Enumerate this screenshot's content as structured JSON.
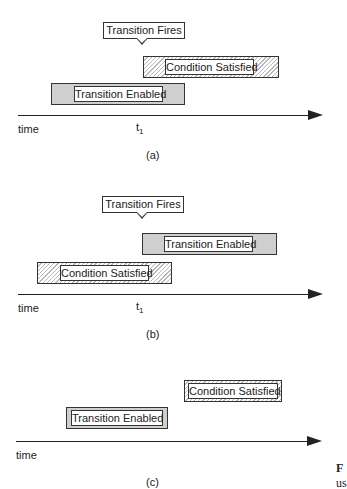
{
  "panels": [
    {
      "id": "a",
      "caption": "(a)",
      "callout": "Transition Fires",
      "bars": [
        {
          "label": "Condition Satisfied",
          "style": "hatched"
        },
        {
          "label": "Transition Enabled",
          "style": "gray"
        }
      ],
      "axis": {
        "label": "time",
        "marker": "t",
        "marker_sub": "1"
      }
    },
    {
      "id": "b",
      "caption": "(b)",
      "callout": "Transition Fires",
      "bars": [
        {
          "label": "Transition Enabled",
          "style": "gray"
        },
        {
          "label": "Condition Satisfied",
          "style": "hatched"
        }
      ],
      "axis": {
        "label": "time",
        "marker": "t",
        "marker_sub": "1"
      }
    },
    {
      "id": "c",
      "caption": "(c)",
      "bars": [
        {
          "label": "Condition Satisfied",
          "style": "hatched-thin"
        },
        {
          "label": "Transition Enabled",
          "style": "gray-thin"
        }
      ],
      "axis": {
        "label": "time"
      }
    }
  ],
  "margin_text": {
    "line1": "F",
    "line2": "us"
  },
  "colors": {
    "gray_fill": "#cfcfcf",
    "stroke": "#333333",
    "background": "#ffffff"
  }
}
